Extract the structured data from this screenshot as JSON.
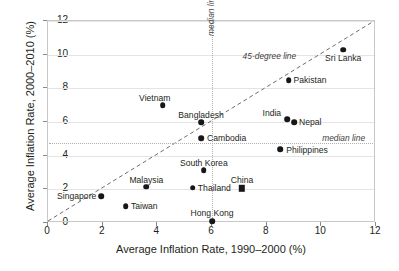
{
  "chart_data": {
    "type": "scatter",
    "title": "",
    "xlabel": "Average Inflation Rate, 1990–2000 (%)",
    "ylabel": "Average Inflation Rate, 2000–2010 (%)",
    "xlim": [
      0,
      12
    ],
    "ylim": [
      0,
      12
    ],
    "xticks": [
      0,
      2,
      4,
      6,
      8,
      10,
      12
    ],
    "yticks": [
      0,
      2,
      4,
      6,
      8,
      10,
      12
    ],
    "xtick_labels": [
      "0",
      "2",
      "4",
      "6",
      "8",
      "10",
      "12"
    ],
    "ytick_labels": [
      "0",
      "2",
      "4",
      "6",
      "8",
      "10",
      "12"
    ],
    "grid": "horizontal",
    "legend": "none",
    "points": [
      {
        "label": "Vietnam",
        "x": 4.2,
        "y": 7.0,
        "marker": "circle",
        "label_dx": -8,
        "label_dy": -11,
        "label_align": "center"
      },
      {
        "label": "Bangladesh",
        "x": 5.6,
        "y": 6.0,
        "marker": "circle",
        "label_dx": 0,
        "label_dy": -11,
        "label_align": "center"
      },
      {
        "label": "Cambodia",
        "x": 5.6,
        "y": 5.05,
        "marker": "circle",
        "label_dx": 6,
        "label_dy": -4,
        "label_align": "left"
      },
      {
        "label": "Sri Lanka",
        "x": 10.8,
        "y": 10.3,
        "marker": "circle",
        "label_dx": 0,
        "label_dy": 4,
        "label_align": "center"
      },
      {
        "label": "Pakistan",
        "x": 8.8,
        "y": 8.5,
        "marker": "circle",
        "label_dx": 5,
        "label_dy": -4,
        "label_align": "left"
      },
      {
        "label": "India",
        "x": 8.75,
        "y": 6.15,
        "marker": "circle",
        "label_dx": -6,
        "label_dy": -10,
        "label_align": "right"
      },
      {
        "label": "Nepal",
        "x": 9.0,
        "y": 6.0,
        "marker": "circle",
        "label_dx": 5,
        "label_dy": -4,
        "label_align": "left"
      },
      {
        "label": "Philippines",
        "x": 8.5,
        "y": 4.4,
        "marker": "circle",
        "label_dx": 6,
        "label_dy": -3,
        "label_align": "left"
      },
      {
        "label": "South Korea",
        "x": 5.7,
        "y": 3.15,
        "marker": "circle",
        "label_dx": 0,
        "label_dy": -11,
        "label_align": "center"
      },
      {
        "label": "Thailand",
        "x": 5.3,
        "y": 2.1,
        "marker": "circle",
        "label_dx": 5,
        "label_dy": -4,
        "label_align": "left"
      },
      {
        "label": "China",
        "x": 7.1,
        "y": 2.05,
        "marker": "square",
        "label_dx": 0,
        "label_dy": -12,
        "label_align": "center"
      },
      {
        "label": "Malaysia",
        "x": 3.6,
        "y": 2.15,
        "marker": "circle",
        "label_dx": 0,
        "label_dy": -11,
        "label_align": "center"
      },
      {
        "label": "Singapore",
        "x": 1.95,
        "y": 1.6,
        "marker": "circle",
        "label_dx": -5,
        "label_dy": -4,
        "label_align": "right"
      },
      {
        "label": "Taiwan",
        "x": 2.85,
        "y": 1.0,
        "marker": "circle",
        "label_dx": 5,
        "label_dy": -4,
        "label_align": "left"
      },
      {
        "label": "Hong Kong",
        "x": 6.0,
        "y": 0.1,
        "marker": "circle",
        "label_dx": 0,
        "label_dy": -12,
        "label_align": "center"
      }
    ],
    "reference_lines": [
      {
        "name": "45-degree line",
        "kind": "diagonal",
        "from": [
          0,
          0
        ],
        "to": [
          12,
          12
        ],
        "style": "dashed",
        "label": "45-degree line",
        "label_x": 8.1,
        "label_y": 9.85
      },
      {
        "name": "median line vertical",
        "kind": "vertical",
        "value": 6.0,
        "style": "dotted",
        "label": "median line",
        "label_x": 5.82,
        "label_y": 11.1
      },
      {
        "name": "median line horizontal",
        "kind": "horizontal",
        "value": 4.75,
        "style": "dotted",
        "label": "median line",
        "label_x": 11.6,
        "label_y": 5.0
      }
    ]
  },
  "colors": {
    "marker": "#17171a",
    "frame": "#c8c8c8",
    "grid": "#e4e4e4",
    "reference": "#b0b0b0",
    "text": "#231f20",
    "annotation": "#44403c"
  }
}
